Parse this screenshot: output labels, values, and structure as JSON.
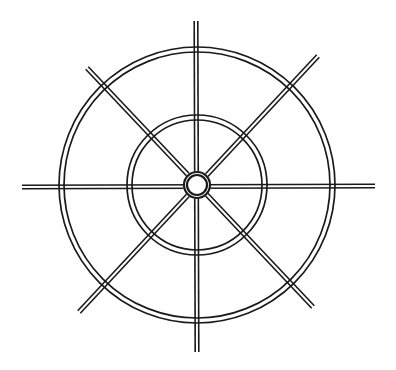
{
  "diagram": {
    "stroke_color": "#1a1a1a",
    "background": "#ffffff",
    "center": [
      197,
      185
    ],
    "outer_ring": {
      "r1": 138,
      "r2": 133
    },
    "inner_ring": {
      "r1": 70,
      "r2": 65
    },
    "hub": {
      "r1": 13,
      "r2": 10
    },
    "spokes": [
      {
        "name": "horizontal",
        "from": [
          22,
          187
        ],
        "to": [
          375,
          186
        ]
      },
      {
        "name": "vertical",
        "from": [
          196,
          21
        ],
        "to": [
          197,
          352
        ]
      },
      {
        "name": "diagonal-tl-br",
        "from": [
          87,
          68
        ],
        "to": [
          313,
          307
        ]
      },
      {
        "name": "diagonal-tr-bl",
        "from": [
          318,
          56
        ],
        "to": [
          79,
          312
        ]
      }
    ]
  }
}
